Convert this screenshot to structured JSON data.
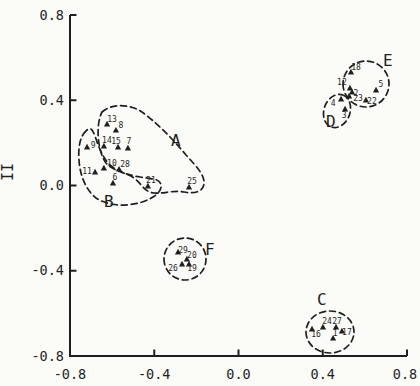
{
  "figure": {
    "background": "#fbfbf8",
    "ink": "#1f1f1f"
  },
  "chart_data": {
    "type": "scatter",
    "title": "",
    "xlabel": "",
    "ylabel": "II",
    "xlim": [
      -0.8,
      0.8
    ],
    "ylim": [
      -0.8,
      0.8
    ],
    "grid": false,
    "legend_position": "none",
    "marker_style": "filled-triangle-up",
    "annotation_style": "hand-drawn dashed cluster outlines",
    "x_tick_labels": [
      "-0.8",
      "-0.4",
      "0.0",
      "0.4",
      "0.8"
    ],
    "x_tick_values": [
      -0.8,
      -0.4,
      0.0,
      0.4,
      0.8
    ],
    "y_tick_labels": [
      "0.8",
      "0.4",
      "0.0",
      "-0.4",
      "-0.8"
    ],
    "y_tick_values": [
      0.8,
      0.4,
      0.0,
      -0.4,
      -0.8
    ],
    "points": [
      {
        "label": "13",
        "x": -0.624,
        "y": 0.289,
        "cluster": "A",
        "dx": 5,
        "dy": -5
      },
      {
        "label": "8",
        "x": -0.582,
        "y": 0.26,
        "cluster": "A",
        "dx": 5,
        "dy": -5
      },
      {
        "label": "14",
        "x": -0.639,
        "y": 0.185,
        "cluster": "A",
        "dx": 3,
        "dy": -6
      },
      {
        "label": "15",
        "x": -0.572,
        "y": 0.181,
        "cluster": "A",
        "dx": -2,
        "dy": -6
      },
      {
        "label": "7",
        "x": -0.525,
        "y": 0.176,
        "cluster": "A",
        "dx": 1,
        "dy": -7
      },
      {
        "label": "9",
        "x": -0.719,
        "y": 0.181,
        "cluster": "B",
        "dx": 6,
        "dy": -2
      },
      {
        "label": "10",
        "x": -0.639,
        "y": 0.082,
        "cluster": "A",
        "dx": 8,
        "dy": -5
      },
      {
        "label": "28",
        "x": -0.567,
        "y": 0.077,
        "cluster": "A",
        "dx": 6,
        "dy": -5
      },
      {
        "label": "11",
        "x": -0.681,
        "y": 0.063,
        "cluster": "B",
        "dx": -8,
        "dy": -1
      },
      {
        "label": "6",
        "x": -0.596,
        "y": 0.012,
        "cluster": "B",
        "dx": 2,
        "dy": -6
      },
      {
        "label": "21",
        "x": -0.43,
        "y": -0.002,
        "cluster": "A",
        "dx": 3,
        "dy": -6
      },
      {
        "label": "25",
        "x": -0.235,
        "y": -0.007,
        "cluster": "A",
        "dx": 3,
        "dy": -6
      },
      {
        "label": "18",
        "x": 0.534,
        "y": 0.533,
        "cluster": "E",
        "dx": 5,
        "dy": -5
      },
      {
        "label": "12",
        "x": 0.529,
        "y": 0.458,
        "cluster": "E",
        "dx": -8,
        "dy": -6
      },
      {
        "label": "2",
        "x": 0.539,
        "y": 0.439,
        "cluster": "E",
        "dx": 4,
        "dy": 1
      },
      {
        "label": "5",
        "x": 0.653,
        "y": 0.448,
        "cluster": "E",
        "dx": 5,
        "dy": -6
      },
      {
        "label": "23",
        "x": 0.525,
        "y": 0.42,
        "cluster": "E",
        "dx": 9,
        "dy": 2
      },
      {
        "label": "22",
        "x": 0.605,
        "y": 0.401,
        "cluster": "E",
        "dx": 6,
        "dy": 1
      },
      {
        "label": "4",
        "x": 0.487,
        "y": 0.406,
        "cluster": "D",
        "dx": -8,
        "dy": 4
      },
      {
        "label": "3",
        "x": 0.506,
        "y": 0.359,
        "cluster": "D",
        "dx": -1,
        "dy": 6
      },
      {
        "label": "29",
        "x": -0.287,
        "y": -0.312,
        "cluster": "F",
        "dx": 5,
        "dy": -2
      },
      {
        "label": "20",
        "x": -0.245,
        "y": -0.345,
        "cluster": "F",
        "dx": 5,
        "dy": -4
      },
      {
        "label": "26",
        "x": -0.268,
        "y": -0.368,
        "cluster": "F",
        "dx": -9,
        "dy": 4
      },
      {
        "label": "19",
        "x": -0.235,
        "y": -0.368,
        "cluster": "F",
        "dx": 3,
        "dy": 4
      },
      {
        "label": "24",
        "x": 0.401,
        "y": -0.664,
        "cluster": "C",
        "dx": 4,
        "dy": -6
      },
      {
        "label": "27",
        "x": 0.463,
        "y": -0.664,
        "cluster": "C",
        "dx": 1,
        "dy": -6
      },
      {
        "label": "16",
        "x": 0.349,
        "y": -0.673,
        "cluster": "C",
        "dx": 4,
        "dy": 5
      },
      {
        "label": "1",
        "x": 0.449,
        "y": -0.716,
        "cluster": "C",
        "dx": 2,
        "dy": -5
      },
      {
        "label": "17",
        "x": 0.491,
        "y": -0.683,
        "cluster": "C",
        "dx": 5,
        "dy": 1
      }
    ],
    "clusters": [
      {
        "label": "A",
        "members": [
          "13",
          "8",
          "14",
          "15",
          "7",
          "10",
          "28",
          "21",
          "25"
        ],
        "label_px": [
          171,
          146
        ],
        "path": "M 102,112 C 112,103 130,104 142,112 C 156,122 172,138 186,155 C 196,166 205,175 204,184 C 203,192 194,194 184,192 C 172,190 164,194 154,193 C 144,192 142,184 134,178 C 126,172 114,172 106,163 C 98,152 95,126 102,112 Z"
      },
      {
        "label": "B",
        "members": [
          "9",
          "11",
          "6",
          "10",
          "28"
        ],
        "label_px": [
          104,
          207
        ],
        "path": "M 86,131 C 80,136 78,148 79,160 C 80,176 86,190 96,198 C 108,206 126,207 142,202 C 154,198 162,192 161,185 C 160,178 150,179 140,177 C 128,175 118,172 110,165 C 102,157 98,145 95,136 C 92,128 90,127 86,131 Z"
      },
      {
        "label": "C",
        "members": [
          "24",
          "27",
          "16",
          "1",
          "17"
        ],
        "label_px": [
          317,
          305
        ],
        "path": "M 306,332 A 24,21 0 1 0 354,332 A 24,21 0 1 0 306,332 Z"
      },
      {
        "label": "D",
        "members": [
          "4",
          "3"
        ],
        "label_px": [
          326,
          127
        ],
        "path": "M 342.8,95 A 13,17 20 1 1 331.2,127 A 13,17 20 1 1 342.8,95 Z"
      },
      {
        "label": "E",
        "members": [
          "18",
          "12",
          "2",
          "5",
          "23",
          "22"
        ],
        "label_px": [
          383,
          66
        ],
        "path": "M 343,84 A 23,23 0 1 0 389,84 A 23,23 0 1 0 343,84 Z"
      },
      {
        "label": "F",
        "members": [
          "29",
          "20",
          "26",
          "19"
        ],
        "label_px": [
          205,
          255
        ],
        "path": "M 164,259 A 21,21 0 1 0 206,259 A 21,21 0 1 0 164,259 Z"
      }
    ]
  }
}
